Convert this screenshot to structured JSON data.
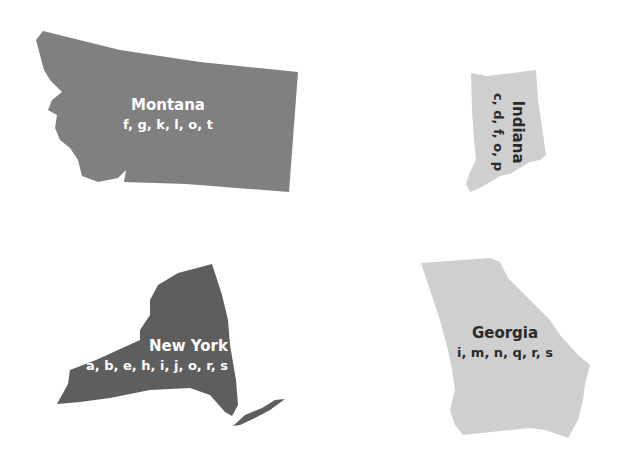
{
  "states": [
    {
      "name": "Montana",
      "letters": "f, g, k, l, o, t",
      "fill": "#808080",
      "text_color": "#ffffff"
    },
    {
      "name": "Indiana",
      "letters": "c, d, f, o, p",
      "fill": "#cfcfcf",
      "text_color": "#2b2b2b"
    },
    {
      "name": "New York",
      "letters": "a, b, e, h, i, j, o, r, s",
      "fill": "#5e5e5e",
      "text_color": "#ffffff"
    },
    {
      "name": "Georgia",
      "letters": "i, m, n, q, r, s",
      "fill": "#cfcfcf",
      "text_color": "#2b2b2b"
    }
  ]
}
